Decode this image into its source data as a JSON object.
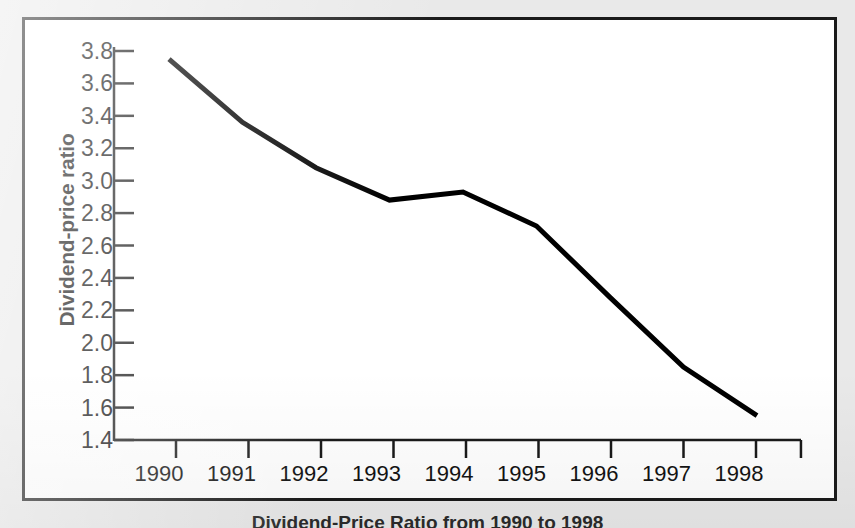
{
  "figure": {
    "caption": "Dividend-Price Ratio from 1990 to 1998",
    "frame_color": "#1a1a1a",
    "page_background": "#e9e9e9",
    "panel_background": "#ffffff"
  },
  "chart_data": {
    "type": "line",
    "title": "",
    "subtitle": "",
    "xlabel": "",
    "ylabel": "Dividend-price ratio",
    "x": [
      1990,
      1991,
      1992,
      1993,
      1994,
      1995,
      1996,
      1997,
      1998
    ],
    "categories": [
      "1990",
      "1991",
      "1992",
      "1993",
      "1994",
      "1995",
      "1996",
      "1997",
      "1998"
    ],
    "values": [
      3.75,
      3.36,
      3.08,
      2.88,
      2.93,
      2.72,
      2.28,
      1.85,
      1.55
    ],
    "series": [
      {
        "name": "Dividend-price ratio",
        "values": [
          3.75,
          3.36,
          3.08,
          2.88,
          2.93,
          2.72,
          2.28,
          1.85,
          1.55
        ],
        "color": "#000000",
        "line_width": 5
      }
    ],
    "xlim": [
      1989.6,
      1998.4
    ],
    "ylim": [
      1.4,
      3.8
    ],
    "ytick_labels": [
      "3.8",
      "3.6",
      "3.4",
      "3.2",
      "3.0",
      "2.8",
      "2.6",
      "2.4",
      "2.2",
      "2.0",
      "1.8",
      "1.6",
      "1.4"
    ],
    "ytick_values": [
      3.8,
      3.6,
      3.4,
      3.2,
      3.0,
      2.8,
      2.6,
      2.4,
      2.2,
      2.0,
      1.8,
      1.6,
      1.4
    ],
    "xtick_labels": [
      "1990",
      "1991",
      "1992",
      "1993",
      "1994",
      "1995",
      "1996",
      "1997",
      "1998"
    ],
    "grid": false,
    "legend": false,
    "legend_position": "none",
    "annotations": []
  }
}
